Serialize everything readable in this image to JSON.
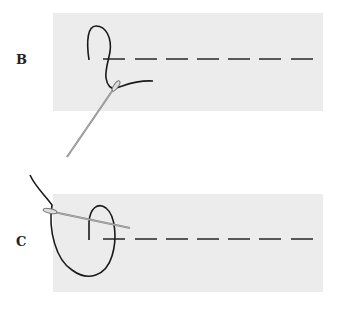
{
  "figure": {
    "panels": [
      {
        "label": "B",
        "description": "Thread looped above stitch line; needle inserted from below, coming up near start of dashed line",
        "fabric": {
          "x": 53,
          "y": 13,
          "w": 270,
          "h": 98,
          "color": "#ececec"
        },
        "stitch_line_y": 59
      },
      {
        "label": "C",
        "description": "Thread wrapped in loop around needle; needle passes through loop near start of dashed line",
        "fabric": {
          "x": 53,
          "y": 194,
          "w": 270,
          "h": 98,
          "color": "#ececec"
        },
        "stitch_line_y": 239
      }
    ],
    "dash_starts_x": [
      103,
      135,
      166,
      197,
      228,
      259,
      291
    ],
    "dash_length": 22,
    "colors": {
      "thread": "#1a1a1a",
      "dash": "#333333",
      "needle": "#888888",
      "label": "#222222"
    }
  }
}
